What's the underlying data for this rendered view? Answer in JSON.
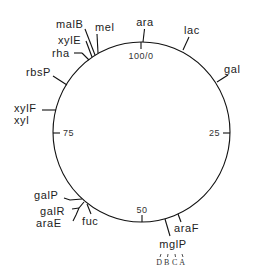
{
  "diagram": {
    "type": "circular-genetic-map",
    "scale": {
      "total": 100,
      "ticks": [
        {
          "value": 0,
          "label": "100/0"
        },
        {
          "value": 25,
          "label": "25"
        },
        {
          "value": 50,
          "label": "50"
        },
        {
          "value": 75,
          "label": "75"
        }
      ]
    },
    "loci": [
      {
        "name": "ara",
        "label": "ara"
      },
      {
        "name": "lac",
        "label": "lac"
      },
      {
        "name": "gal",
        "label": "gal"
      },
      {
        "name": "araF",
        "label": "araF"
      },
      {
        "name": "mglP",
        "label": "mglP"
      },
      {
        "name": "fuc",
        "label": "fuc"
      },
      {
        "name": "araE",
        "label": "araE"
      },
      {
        "name": "galR",
        "label": "galR"
      },
      {
        "name": "galP",
        "label": "galP"
      },
      {
        "name": "xylF",
        "label": "xylF"
      },
      {
        "name": "xyl",
        "label": "xyl"
      },
      {
        "name": "rbsP",
        "label": "rbsP"
      },
      {
        "name": "rha",
        "label": "rha"
      },
      {
        "name": "xylE",
        "label": "xylE"
      },
      {
        "name": "malB",
        "label": "malB"
      },
      {
        "name": "mel",
        "label": "mel"
      }
    ],
    "mglP_subunits": [
      "D",
      "B",
      "C",
      "A"
    ]
  }
}
